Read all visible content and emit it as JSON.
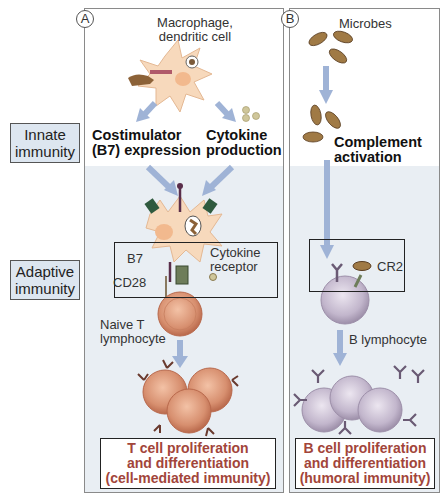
{
  "panels": {
    "A": {
      "badge": "A",
      "title": "Macrophage,\ndendritic cell",
      "title_line1": "Macrophage,",
      "title_line2": "dendritic cell",
      "left_branch_line1": "Costimulator",
      "left_branch_line2": "(B7) expression",
      "right_branch_line1": "Cytokine",
      "right_branch_line2": "production",
      "b7_label": "B7",
      "cd28_label": "CD28",
      "cytokine_receptor_line1": "Cytokine",
      "cytokine_receptor_line2": "receptor",
      "naive_line1": "Naive T",
      "naive_line2": "lymphocyte",
      "outcome_line1": "T cell proliferation",
      "outcome_line2": "and differentiation",
      "outcome_line3": "(cell-mediated immunity)"
    },
    "B": {
      "badge": "B",
      "title": "Microbes",
      "complement_line1": "Complement",
      "complement_line2": "activation",
      "cr2_label": "CR2",
      "b_lymph_label": "B lymphocyte",
      "outcome_line1": "B cell proliferation",
      "outcome_line2": "and differentiation",
      "outcome_line3": "(humoral immunity)"
    }
  },
  "side_labels": {
    "innate_line1": "Innate",
    "innate_line2": "immunity",
    "adaptive_line1": "Adaptive",
    "adaptive_line2": "immunity"
  },
  "colors": {
    "outcome_text": "#a2453a",
    "side_label_bg": "#dde6f0",
    "adaptive_shade": "#e9eef3",
    "arrow": "#9fb3d6",
    "t_cell": "#d99a7e",
    "b_cell": "#c2b6cc",
    "macrophage": "#f6d7b8",
    "microbe": "#a07a45"
  }
}
